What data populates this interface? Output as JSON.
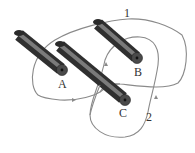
{
  "diagram": {
    "wires": [
      {
        "id": "A",
        "label": "A"
      },
      {
        "id": "B",
        "label": "B"
      },
      {
        "id": "C",
        "label": "C"
      }
    ],
    "loops": [
      {
        "id": "1",
        "label": "1"
      },
      {
        "id": "2",
        "label": "2"
      }
    ],
    "colors": {
      "wire_dark": "#3a3a3a",
      "wire_light": "#9a9a9a",
      "loop": "#8a8a8a",
      "label": "#333333",
      "background": "#ffffff"
    }
  }
}
